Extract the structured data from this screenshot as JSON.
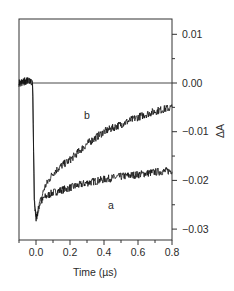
{
  "chart_data": {
    "type": "line",
    "title": "",
    "xlabel": "Time (µs)",
    "ylabel": "ΔA",
    "xlim": [
      -0.1,
      0.8
    ],
    "ylim": [
      -0.0325,
      0.0125
    ],
    "x_ticks": [
      0.0,
      0.2,
      0.4,
      0.6,
      0.8
    ],
    "x_tick_labels": [
      "0.0",
      "0.2",
      "0.4",
      "0.6",
      "0.8"
    ],
    "x_minor_ticks": [
      -0.1,
      0.1,
      0.3,
      0.5,
      0.7
    ],
    "y_ticks": [
      0.01,
      0.0,
      -0.01,
      -0.02,
      -0.03
    ],
    "y_tick_labels": [
      "0.01",
      "0.00",
      "−0.01",
      "−0.02",
      "−0.03"
    ],
    "y_minor_ticks": [
      0.005,
      -0.005,
      -0.015,
      -0.025
    ],
    "y_axis_side": "right",
    "grid": false,
    "legend": null,
    "zero_line": true,
    "series": [
      {
        "name": "a",
        "x": [
          -0.1,
          -0.05,
          -0.02,
          -0.01,
          0.0,
          0.02,
          0.05,
          0.1,
          0.15,
          0.2,
          0.3,
          0.4,
          0.5,
          0.6,
          0.7,
          0.8
        ],
        "values": [
          0.0,
          0.0005,
          0.0,
          -0.024,
          -0.028,
          -0.025,
          -0.0235,
          -0.0225,
          -0.022,
          -0.0215,
          -0.0205,
          -0.0198,
          -0.0192,
          -0.0188,
          -0.0183,
          -0.018
        ]
      },
      {
        "name": "b",
        "x": [
          -0.1,
          -0.05,
          -0.02,
          -0.01,
          0.0,
          0.02,
          0.05,
          0.1,
          0.15,
          0.2,
          0.3,
          0.4,
          0.5,
          0.6,
          0.7,
          0.8
        ],
        "values": [
          0.0,
          0.0005,
          0.0,
          -0.024,
          -0.028,
          -0.025,
          -0.0215,
          -0.0185,
          -0.017,
          -0.0158,
          -0.0125,
          -0.01,
          -0.0085,
          -0.007,
          -0.0058,
          -0.005
        ]
      }
    ],
    "annotations": [
      {
        "text": "b",
        "x": 0.3,
        "y": -0.0073
      },
      {
        "text": "a",
        "x": 0.44,
        "y": -0.0258
      }
    ]
  }
}
